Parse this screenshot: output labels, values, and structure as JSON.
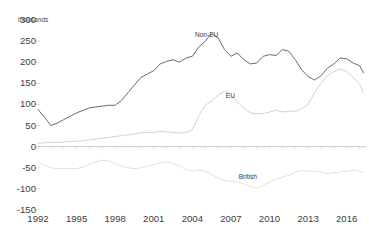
{
  "top_strip": {
    "fragments": [
      {
        "text": "•",
        "x": 16
      },
      {
        "text": "•",
        "x": 94
      },
      {
        "text": "·",
        "x": 186
      },
      {
        "text": "·",
        "x": 243
      }
    ]
  },
  "chart_data": {
    "type": "line",
    "title": "",
    "subtitle": "",
    "unit_label": "thousands",
    "xlabel": "",
    "ylabel": "",
    "ylim": [
      -150,
      300
    ],
    "xlim": [
      1992,
      2017.5
    ],
    "grid": false,
    "zero_line": true,
    "legend_position": "inline-annotations",
    "ytick_labels": [
      "300",
      "250",
      "200",
      "150",
      "100",
      "50",
      "0",
      "-50",
      "-100",
      "-150"
    ],
    "ytick_values": [
      300,
      250,
      200,
      150,
      100,
      50,
      0,
      -50,
      -100,
      -150
    ],
    "xtick_labels": [
      "1992",
      "1995",
      "1998",
      "2001",
      "2004",
      "2007",
      "2010",
      "2013",
      "2016"
    ],
    "xtick_values": [
      1992,
      1995,
      1998,
      2001,
      2004,
      2007,
      2010,
      2013,
      2016
    ],
    "colors": {
      "non_eu": "#6b6b6b",
      "eu": "#d2d2d2",
      "british": "#e2e2e2",
      "axis": "#c9c9c9",
      "text": "#3d3d3d"
    },
    "x": [
      1992.0,
      1992.5,
      1993.0,
      1993.5,
      1994.0,
      1994.5,
      1995.0,
      1995.5,
      1996.0,
      1996.5,
      1997.0,
      1997.5,
      1998.0,
      1998.5,
      1999.0,
      1999.5,
      2000.0,
      2000.5,
      2001.0,
      2001.5,
      2002.0,
      2002.5,
      2003.0,
      2003.5,
      2004.0,
      2004.5,
      2005.0,
      2005.5,
      2006.0,
      2006.5,
      2007.0,
      2007.5,
      2008.0,
      2008.5,
      2009.0,
      2009.5,
      2010.0,
      2010.5,
      2011.0,
      2011.5,
      2012.0,
      2012.5,
      2013.0,
      2013.5,
      2014.0,
      2014.5,
      2015.0,
      2015.5,
      2016.0,
      2016.5,
      2017.0,
      2017.3
    ],
    "series": [
      {
        "name": "Non-EU",
        "key": "non_eu",
        "color": "#6b6b6b",
        "label_x": 2004.2,
        "label_y": 262,
        "values": [
          88,
          70,
          50,
          56,
          64,
          72,
          80,
          86,
          92,
          94,
          96,
          98,
          98,
          110,
          128,
          146,
          164,
          172,
          180,
          196,
          202,
          206,
          200,
          210,
          214,
          236,
          250,
          268,
          258,
          230,
          214,
          222,
          206,
          196,
          198,
          214,
          218,
          216,
          230,
          226,
          206,
          182,
          166,
          158,
          168,
          186,
          196,
          210,
          208,
          198,
          192,
          175
        ]
      },
      {
        "name": "EU",
        "key": "eu",
        "color": "#d2d2d2",
        "label_x": 2006.6,
        "label_y": 118,
        "values": [
          8,
          9,
          10,
          10,
          11,
          12,
          13,
          14,
          16,
          18,
          20,
          22,
          24,
          26,
          28,
          30,
          33,
          34,
          34,
          36,
          35,
          34,
          32,
          34,
          40,
          74,
          98,
          108,
          122,
          132,
          124,
          106,
          92,
          80,
          78,
          78,
          82,
          86,
          82,
          84,
          84,
          90,
          100,
          128,
          150,
          168,
          178,
          184,
          178,
          164,
          148,
          128
        ]
      },
      {
        "name": "British",
        "key": "british",
        "color": "#e2e2e2",
        "label_x": 2007.6,
        "label_y": -74,
        "values": [
          -36,
          -44,
          -50,
          -52,
          -52,
          -52,
          -52,
          -48,
          -42,
          -36,
          -32,
          -34,
          -40,
          -46,
          -50,
          -52,
          -50,
          -46,
          -42,
          -38,
          -36,
          -40,
          -46,
          -54,
          -58,
          -56,
          -58,
          -66,
          -74,
          -80,
          -82,
          -84,
          -88,
          -94,
          -98,
          -92,
          -84,
          -78,
          -72,
          -68,
          -60,
          -56,
          -58,
          -58,
          -60,
          -64,
          -62,
          -60,
          -58,
          -56,
          -58,
          -60
        ]
      }
    ]
  }
}
